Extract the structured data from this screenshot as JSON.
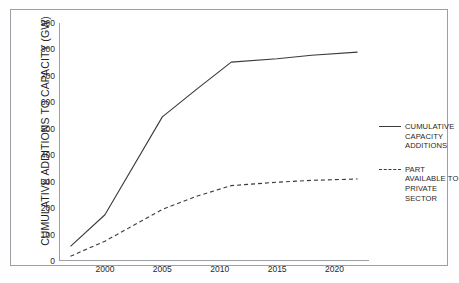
{
  "chart_data": {
    "type": "line",
    "title": "",
    "xlabel": "",
    "ylabel": "CUMULATIVE ADDITIONS TO CAPACITY (GW)",
    "xlim": [
      1996,
      2023
    ],
    "ylim": [
      0,
      900
    ],
    "xticks": [
      2000,
      2005,
      2010,
      2015,
      2020
    ],
    "xtick_labels": [
      "2000",
      "2005",
      "2010",
      "2015",
      "2020"
    ],
    "yticks": [
      0,
      100,
      200,
      300,
      400,
      500,
      600,
      700,
      800,
      900
    ],
    "ytick_labels": [
      "0",
      "100",
      "200",
      "300",
      "400",
      "500",
      "600",
      "700",
      "800",
      "900"
    ],
    "grid": false,
    "legend_position": "right",
    "series": [
      {
        "name": "CUMULATIVE CAPACITY ADDITIONS",
        "style": "solid",
        "color": "#3a3a3a",
        "x": [
          1997,
          2000,
          2005,
          2008,
          2011,
          2015,
          2018,
          2022
        ],
        "values": [
          55,
          175,
          545,
          650,
          752,
          765,
          778,
          790
        ]
      },
      {
        "name": "PART AVAILABLE TO PRIVATE SECTOR",
        "style": "dashed",
        "color": "#3a3a3a",
        "x": [
          1997,
          2000,
          2005,
          2008,
          2011,
          2015,
          2018,
          2022
        ],
        "values": [
          18,
          75,
          195,
          245,
          285,
          298,
          305,
          310
        ]
      }
    ]
  },
  "axes": {
    "y_title": "CUMULATIVE ADDITIONS TO CAPACITY (GW)"
  },
  "legend": {
    "items": [
      {
        "label": "CUMULATIVE\nCAPACITY\nADDITIONS",
        "style": "solid"
      },
      {
        "label": "PART\nAVAILABLE TO\nPRIVATE\nSECTOR",
        "style": "dashed"
      }
    ]
  },
  "colors": {
    "line": "#3a3a3a",
    "axis": "#9aa0a6",
    "frame": "#9aa0a6",
    "text": "#1f1f1f",
    "background": "#ffffff"
  }
}
